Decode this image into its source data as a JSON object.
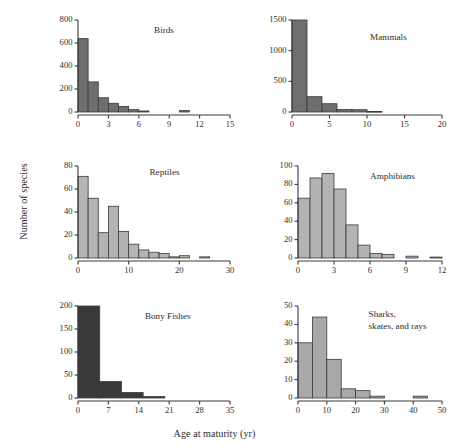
{
  "figure": {
    "xlabel": "Age at maturity (yr)",
    "ylabel": "Number of species"
  },
  "chart_data": [
    {
      "type": "bar",
      "title": "Birds",
      "xlabel": "Age at maturity (yr)",
      "ylabel": "Number of species",
      "xlim": [
        0,
        15
      ],
      "ylim": [
        0,
        800
      ],
      "xticks": [
        0,
        3,
        6,
        9,
        12,
        15
      ],
      "yticks": [
        0,
        200,
        400,
        600,
        800
      ],
      "bin_width": 1,
      "fill_color": "#6e6e6e",
      "bin_starts": [
        0,
        1,
        2,
        3,
        4,
        5,
        6,
        7,
        8,
        9,
        10,
        11,
        12,
        13,
        14
      ],
      "values": [
        638,
        262,
        124,
        76,
        49,
        21,
        9,
        3,
        2,
        1,
        12,
        1,
        1,
        1,
        0
      ],
      "grid": false,
      "legend": "none"
    },
    {
      "type": "bar",
      "title": "Mammals",
      "xlabel": "Age at maturity (yr)",
      "ylabel": "Number of species",
      "xlim": [
        0,
        20
      ],
      "ylim": [
        0,
        1500
      ],
      "xticks": [
        0,
        5,
        10,
        15,
        20
      ],
      "yticks": [
        0,
        500,
        1000,
        1500
      ],
      "bin_width": 2,
      "fill_color": "#6e6e6e",
      "bin_starts": [
        0,
        2,
        4,
        6,
        8,
        10,
        12,
        14,
        16
      ],
      "values": [
        1530,
        250,
        135,
        42,
        38,
        10,
        6,
        3,
        2
      ],
      "grid": false,
      "legend": "none"
    },
    {
      "type": "bar",
      "title": "Reptiles",
      "xlabel": "Age at maturity (yr)",
      "ylabel": "Number of species",
      "xlim": [
        0,
        30
      ],
      "ylim": [
        0,
        80
      ],
      "xticks": [
        0,
        10,
        20,
        30
      ],
      "yticks": [
        0,
        20,
        40,
        60,
        80
      ],
      "bin_width": 2,
      "fill_color": "#b4b4b4",
      "bin_starts": [
        0,
        2,
        4,
        6,
        8,
        10,
        12,
        14,
        16,
        18,
        20,
        22,
        24
      ],
      "values": [
        71,
        52,
        22,
        45,
        23,
        12,
        7,
        5,
        4,
        1,
        2,
        0,
        1
      ],
      "grid": false,
      "legend": "none"
    },
    {
      "type": "bar",
      "title": "Amphibians",
      "xlabel": "Age at maturity (yr)",
      "ylabel": "Number of species",
      "xlim": [
        0,
        12
      ],
      "ylim": [
        0,
        100
      ],
      "xticks": [
        0,
        3,
        6,
        9,
        12
      ],
      "yticks": [
        0,
        20,
        40,
        60,
        80,
        100
      ],
      "bin_width": 1,
      "fill_color": "#b4b4b4",
      "bin_starts": [
        0,
        1,
        2,
        3,
        4,
        5,
        6,
        7,
        8,
        9,
        10,
        11
      ],
      "values": [
        65,
        87,
        92,
        75,
        36,
        14,
        5,
        4,
        0,
        2,
        0,
        1
      ],
      "grid": false,
      "legend": "none"
    },
    {
      "type": "bar",
      "title": "Bony Fishes",
      "xlabel": "Age at maturity (yr)",
      "ylabel": "Number of species",
      "xlim": [
        0,
        35
      ],
      "ylim": [
        0,
        200
      ],
      "xticks": [
        0,
        7,
        14,
        21,
        28,
        35
      ],
      "yticks": [
        0,
        50,
        100,
        150,
        200
      ],
      "bin_width": 5,
      "fill_color": "#3a3a3a",
      "bin_starts": [
        0,
        5,
        10,
        15,
        20,
        25,
        30
      ],
      "values": [
        203,
        36,
        12,
        3,
        1,
        1,
        1
      ],
      "grid": false,
      "legend": "none"
    },
    {
      "type": "bar",
      "title": "Sharks,\nskates, and rays",
      "title_lines": [
        "Sharks,",
        "skates, and rays"
      ],
      "xlabel": "Age at maturity (yr)",
      "ylabel": "Number of species",
      "xlim": [
        0,
        50
      ],
      "ylim": [
        0,
        50
      ],
      "xticks": [
        0,
        10,
        20,
        30,
        40,
        50
      ],
      "yticks": [
        0,
        10,
        20,
        30,
        40,
        50
      ],
      "bin_width": 5,
      "fill_color": "#a8a8a8",
      "bin_starts": [
        0,
        5,
        10,
        15,
        20,
        25,
        30,
        35,
        40,
        45
      ],
      "values": [
        30,
        44,
        21,
        5,
        4,
        1,
        0,
        0,
        1,
        0
      ],
      "grid": false,
      "legend": "none"
    }
  ],
  "panel_layout": [
    {
      "index": 0,
      "left": 44,
      "top": 14,
      "plot_w": 152,
      "plot_h": 92,
      "title_x": 0.5,
      "title_y": 0.14
    },
    {
      "index": 1,
      "left": 258,
      "top": 14,
      "plot_w": 150,
      "plot_h": 92,
      "title_x": 0.52,
      "title_y": 0.22
    },
    {
      "index": 2,
      "left": 44,
      "top": 160,
      "plot_w": 152,
      "plot_h": 92,
      "title_x": 0.47,
      "title_y": 0.1
    },
    {
      "index": 3,
      "left": 264,
      "top": 160,
      "plot_w": 144,
      "plot_h": 92,
      "title_x": 0.5,
      "title_y": 0.14
    },
    {
      "index": 4,
      "left": 44,
      "top": 300,
      "plot_w": 152,
      "plot_h": 92,
      "title_x": 0.44,
      "title_y": 0.14
    },
    {
      "index": 5,
      "left": 264,
      "top": 300,
      "plot_w": 144,
      "plot_h": 92,
      "title_x": 0.49,
      "title_y": 0.12
    }
  ]
}
